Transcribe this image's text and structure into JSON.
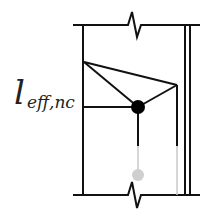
{
  "diagram": {
    "label_main": "l",
    "label_sub": "eff,nc",
    "colors": {
      "line": "#111111",
      "faded": "#c8c8c8",
      "node": "#000000",
      "faded_node": "#cfcfcf"
    }
  }
}
